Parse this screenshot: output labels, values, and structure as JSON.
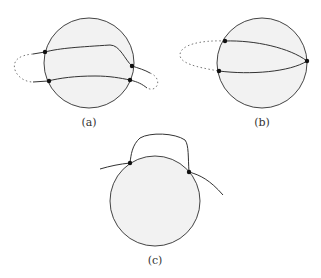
{
  "figure": {
    "panels": [
      {
        "id": "a",
        "label": "(a)"
      },
      {
        "id": "b",
        "label": "(b)"
      },
      {
        "id": "c",
        "label": "(c)"
      }
    ],
    "colors": {
      "disk_fill": "#f2f2f2",
      "stroke": "#333333",
      "dot": "#111111"
    }
  }
}
